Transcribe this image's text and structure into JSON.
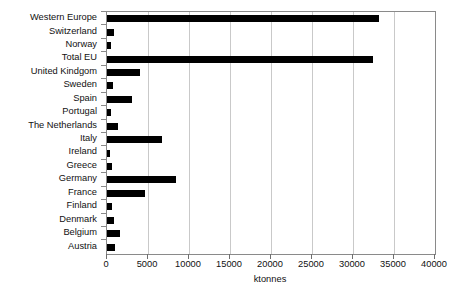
{
  "chart_data": {
    "type": "bar",
    "orientation": "horizontal",
    "title": "",
    "subtitle": "",
    "xlabel": "ktonnes",
    "ylabel": "",
    "xlim": [
      0,
      40000
    ],
    "xticks": [
      0,
      5000,
      10000,
      15000,
      20000,
      25000,
      30000,
      35000,
      40000
    ],
    "xtick_labels": [
      "0",
      "5000",
      "10000",
      "15000",
      "20000",
      "25000",
      "30000",
      "35000",
      "40000"
    ],
    "grid": "vertical",
    "legend": "none",
    "bar_color": "#000000",
    "categories": [
      "Western Europe",
      "Switzerland",
      "Norway",
      "Total EU",
      "United Kindgom",
      "Sweden",
      "Spain",
      "Portugal",
      "The Netherlands",
      "Italy",
      "Ireland",
      "Greece",
      "Germany",
      "France",
      "Finland",
      "Denmark",
      "Belgium",
      "Austria"
    ],
    "values": [
      33200,
      830,
      480,
      32450,
      4050,
      760,
      3000,
      450,
      1400,
      6750,
      400,
      600,
      8450,
      4600,
      650,
      800,
      1550,
      950
    ]
  }
}
